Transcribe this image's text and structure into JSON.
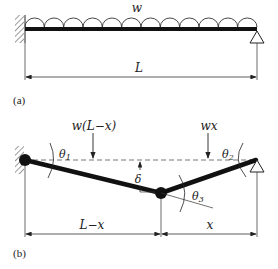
{
  "figure": {
    "panel_a": {
      "label": "(a)",
      "load_label": "w",
      "span_label": "L",
      "left_support": "fixed-wall",
      "right_support": "pin-roller"
    },
    "panel_b": {
      "label": "(b)",
      "left_load_label": "w(L−x)",
      "right_load_label": "wx",
      "angle_left": "θ",
      "angle_left_sub": "1",
      "angle_right": "θ",
      "angle_right_sub": "2",
      "angle_hinge": "θ",
      "angle_hinge_sub": "3",
      "deflection_label": "δ",
      "left_span_label": "L−x",
      "right_span_label": "x"
    }
  },
  "colors": {
    "ink": "#111111",
    "hatch": "#555555",
    "dim": "#333333"
  }
}
